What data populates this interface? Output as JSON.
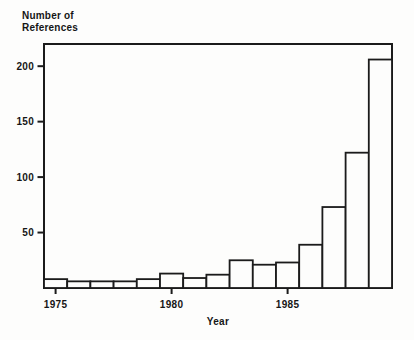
{
  "chart": {
    "title_line1": "Number of",
    "title_line2": "References",
    "xlabel": "Year"
  },
  "chart_data": {
    "type": "bar",
    "title": "Number of References",
    "xlabel": "Year",
    "ylabel": "Number of References",
    "categories": [
      1975,
      1976,
      1977,
      1978,
      1979,
      1980,
      1981,
      1982,
      1983,
      1984,
      1985,
      1986,
      1987,
      1988,
      1989
    ],
    "values": [
      8,
      6,
      6,
      6,
      8,
      13,
      9,
      12,
      25,
      21,
      23,
      39,
      73,
      122,
      206
    ],
    "x_ticks": [
      1975,
      1980,
      1985
    ],
    "y_ticks": [
      50,
      100,
      150,
      200
    ],
    "ylim": [
      0,
      220
    ],
    "grid": false,
    "legend": "none",
    "bar_fill": "#fdfdfc",
    "line_color": "#1b1b1b",
    "background": "#fdfdfc"
  }
}
